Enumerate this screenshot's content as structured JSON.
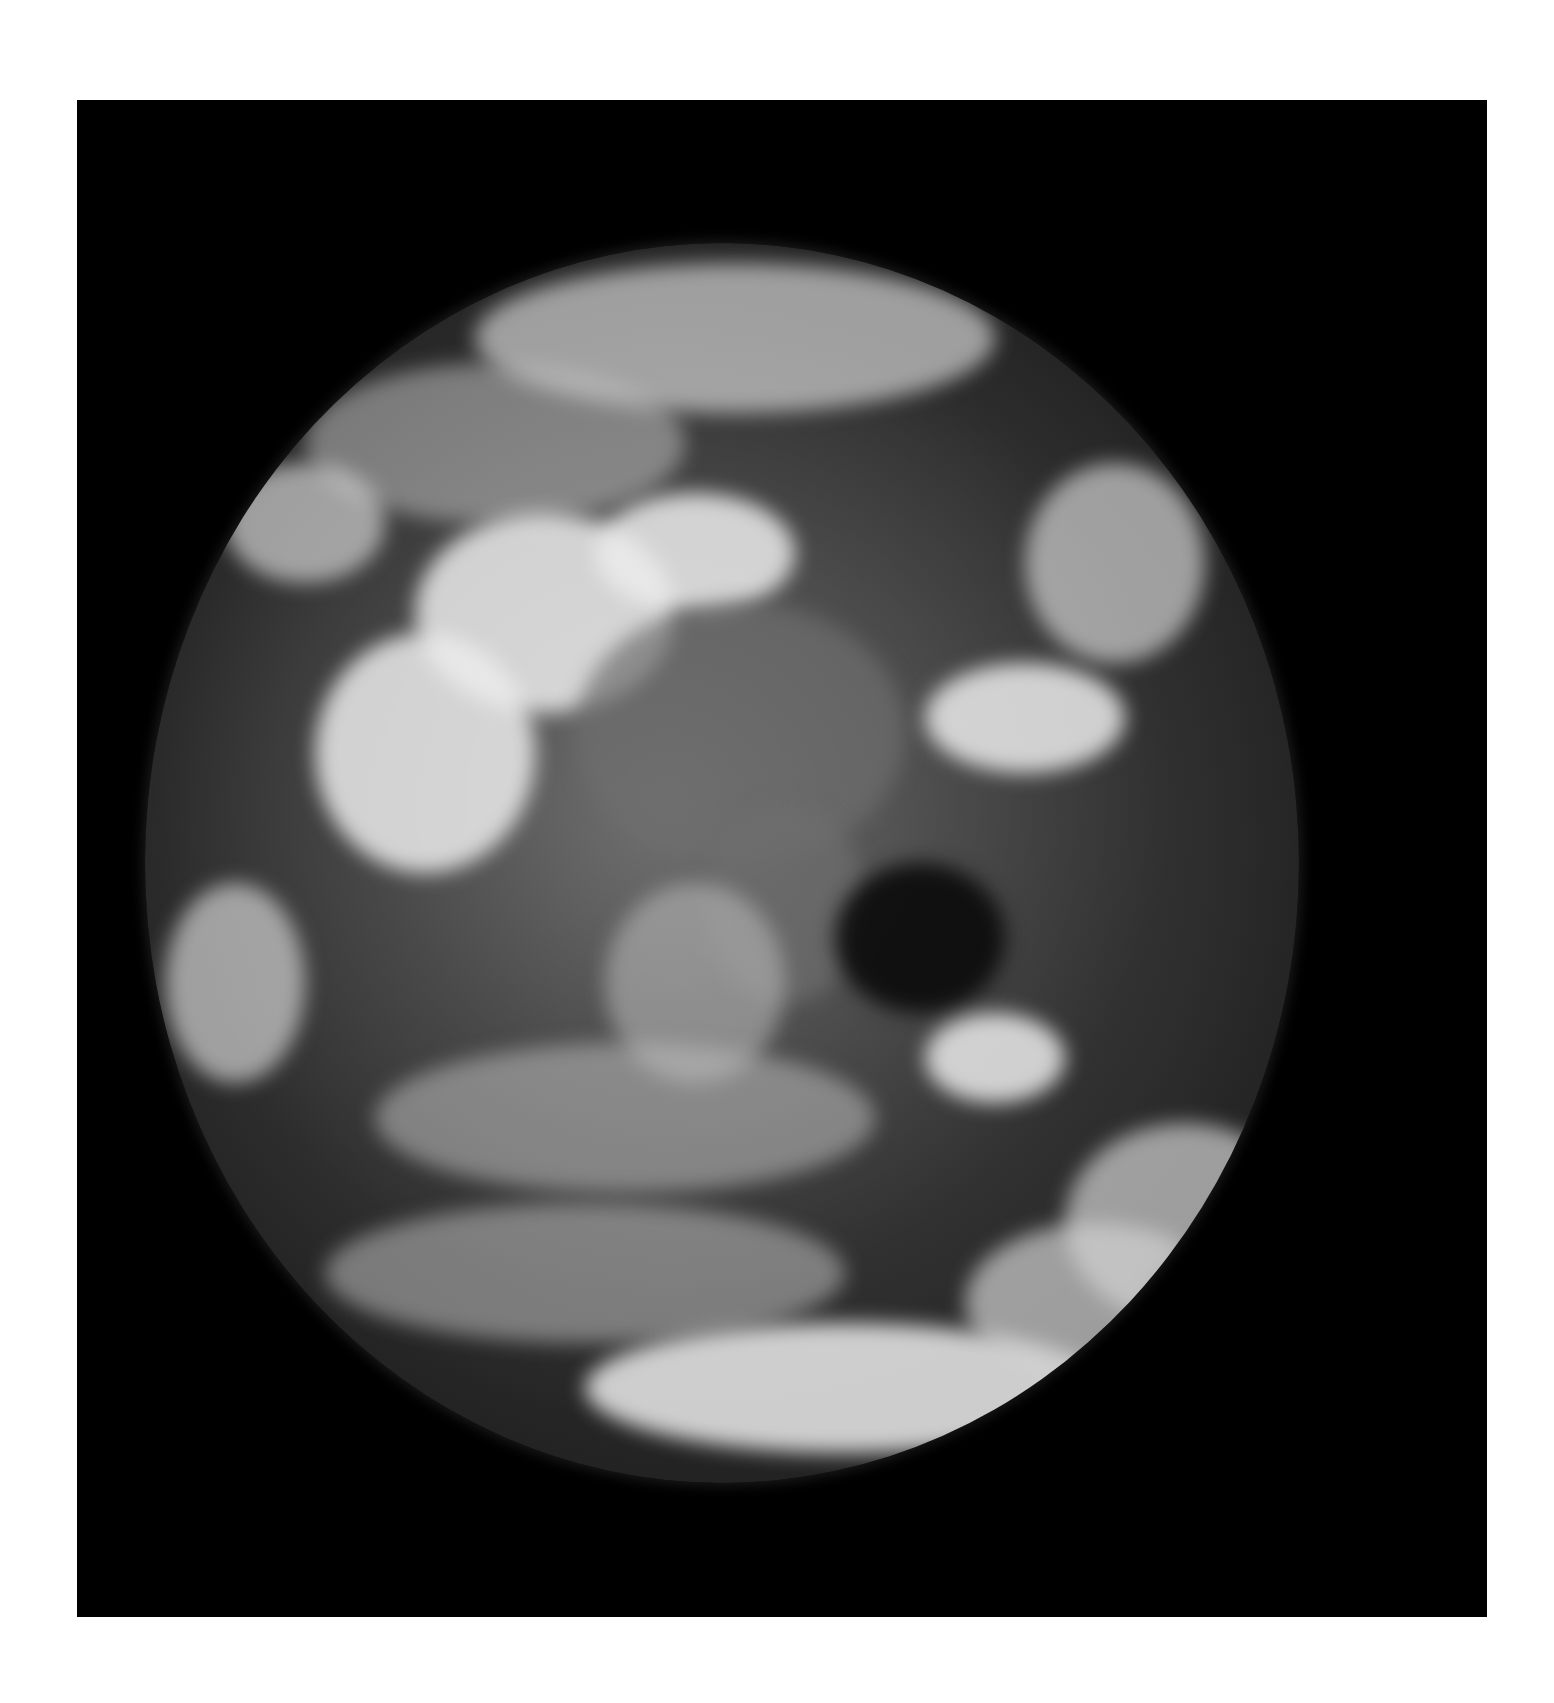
{
  "image": {
    "subject": "Earth seen from space (grayscale)",
    "background_color": "#000000",
    "page_color": "#ffffff",
    "frame": {
      "x": 77,
      "y": 100,
      "width": 1410,
      "height": 1517
    },
    "globe": {
      "center_x": 720,
      "center_y": 860,
      "radius_x": 577,
      "radius_y": 620
    }
  }
}
